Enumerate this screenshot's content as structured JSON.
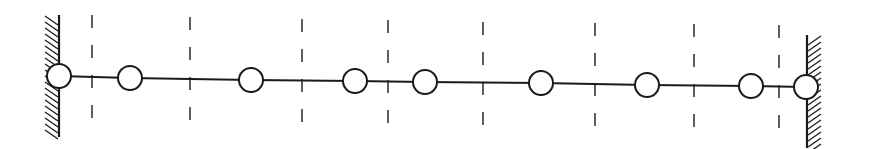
{
  "diagram": {
    "stroke_color": "#1a1a1a",
    "background": "#ffffff",
    "walls": [
      {
        "side": "left",
        "x": 59,
        "y1": 15,
        "y2": 137,
        "hatch_dir": -1
      },
      {
        "side": "right",
        "x": 807,
        "y1": 35,
        "y2": 148,
        "hatch_dir": 1
      }
    ],
    "masses": [
      {
        "cx": 59,
        "cy": 76
      },
      {
        "cx": 130,
        "cy": 78
      },
      {
        "cx": 251,
        "cy": 80
      },
      {
        "cx": 355,
        "cy": 81
      },
      {
        "cx": 425,
        "cy": 82
      },
      {
        "cx": 541,
        "cy": 83
      },
      {
        "cx": 647,
        "cy": 85
      },
      {
        "cx": 751,
        "cy": 86
      },
      {
        "cx": 806,
        "cy": 87
      }
    ],
    "mass_radius": 12,
    "dashed_lines": [
      {
        "x": 92,
        "y1": 15,
        "y2": 130
      },
      {
        "x": 190,
        "y1": 17,
        "y2": 133
      },
      {
        "x": 302,
        "y1": 19,
        "y2": 135
      },
      {
        "x": 388,
        "y1": 20,
        "y2": 136
      },
      {
        "x": 483,
        "y1": 22,
        "y2": 137
      },
      {
        "x": 595,
        "y1": 23,
        "y2": 139
      },
      {
        "x": 694,
        "y1": 24,
        "y2": 140
      },
      {
        "x": 779,
        "y1": 25,
        "y2": 141
      }
    ]
  }
}
